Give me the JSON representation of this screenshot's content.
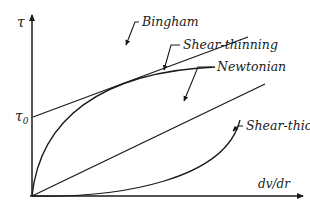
{
  "diagram": {
    "title": "",
    "axes": {
      "y_label": "τ",
      "y_intercept_label": "τ0",
      "y_intercept_main": "τ",
      "y_intercept_sub": "0",
      "x_label": "dv/dr"
    },
    "curves": [
      {
        "id": "bingham",
        "label": "Bingham",
        "shape": "straight line with yield stress intercept"
      },
      {
        "id": "shear-thinning",
        "label": "Shear-thinning",
        "shape": "concave curve from origin"
      },
      {
        "id": "newtonian",
        "label": "Newtonian",
        "shape": "straight line from origin"
      },
      {
        "id": "shear-thickening",
        "label": "Shear-thickening",
        "shape": "convex curve from origin"
      }
    ],
    "colors": {
      "ink": "#1a1a1a",
      "background": "#ffffff"
    }
  }
}
